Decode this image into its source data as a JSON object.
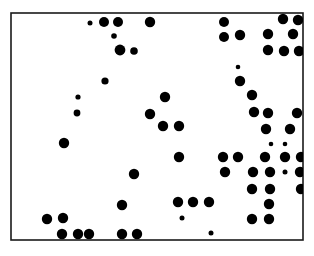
{
  "figure": {
    "name": "distribution-dot-map",
    "type": "dot-distribution-map",
    "background_color": "#ffffff",
    "ink_color": "#000000",
    "caption": "",
    "title": ""
  },
  "frame": {
    "x": 11,
    "y": 13,
    "width": 292,
    "height": 227,
    "stroke_color": "#1a1a1a",
    "stroke_width": 1.6
  },
  "grid": {
    "columns": 4,
    "rows": 3,
    "vertical_lines_x": [
      86,
      156,
      230
    ],
    "horizontal_lines_y": [
      89,
      165
    ],
    "stroke_color": "#1a1a1a",
    "stroke_width": 1.1
  },
  "rivers": [
    {
      "name": "western-river",
      "points": "33,33 38,29 44,28 49,32 55,35 60,33 65,35 68,40 72,43 74,48 72,53 73,58 76,61 78,66 76,71 78,76 77,81 79,86 77,91 79,96 78,101 80,106 78,111 81,116 80,121 83,126 86,130 90,134 94,138 99,142 104,147 108,152 110,157 112,162 111,167 113,172 112,177 114,182 113,187 115,192 114,197 116,202 118,207 120,212 121,217 120,223 122,228 122,234 122,239"
    },
    {
      "name": "eastern-river",
      "points": "156,12 158,18 157,24 159,30 161,36 163,42 166,48 169,54 172,59 175,64 179,69 183,73 187,77 190,82 193,87 196,91 199,95 203,98 206,101 209,103 212,101 215,99 217,96 215,92 212,90 209,89 206,87 204,84 203,80 205,77 209,76 213,75 217,73 219,70 221,66 224,63 227,61 230,59 233,57 236,54 239,50 241,45 243,40 245,35 247,30 249,25 251,20 253,15 254,12"
    },
    {
      "name": "central-river",
      "points": "230,89 232,93 234,97 237,101 240,105 243,109 246,113 248,118 250,123 252,128 253,133 255,138 257,143 256,148 254,152 252,157 250,162 249,167 250,172 252,177 254,182 253,187 250,190 246,192 242,193 238,194 234,196 231,199 228,202 224,205 221,209 218,213 216,218 215,223 214,229 214,234 213,239"
    },
    {
      "name": "river-tributary-lower",
      "points": "229,194 224,193 220,194 217,197 215,201 212,203 209,202 207,199 205,197 202,198 200,202 199,207 199,212 200,217 199,222 200,227 201,232 201,238"
    }
  ],
  "dots": [
    {
      "cell": "r1c2",
      "x": 90,
      "y": 23,
      "r": 2.5
    },
    {
      "cell": "r1c2",
      "x": 104,
      "y": 22,
      "r": 5.0
    },
    {
      "cell": "r1c2",
      "x": 118,
      "y": 22,
      "r": 5.0
    },
    {
      "cell": "r1c2",
      "x": 150,
      "y": 22,
      "r": 5.2
    },
    {
      "cell": "r1c2",
      "x": 114,
      "y": 36,
      "r": 2.8
    },
    {
      "cell": "r1c2",
      "x": 120,
      "y": 50,
      "r": 5.4
    },
    {
      "cell": "r1c2",
      "x": 134,
      "y": 51,
      "r": 3.8
    },
    {
      "cell": "r1c2",
      "x": 105,
      "y": 81,
      "r": 3.6
    },
    {
      "cell": "r1c3",
      "x": 224,
      "y": 22,
      "r": 5.0
    },
    {
      "cell": "r1c3",
      "x": 224,
      "y": 37,
      "r": 5.0
    },
    {
      "cell": "r1c4",
      "x": 240,
      "y": 35,
      "r": 5.2
    },
    {
      "cell": "r1c4",
      "x": 283,
      "y": 19,
      "r": 5.2
    },
    {
      "cell": "r1c4",
      "x": 298,
      "y": 20,
      "r": 5.2
    },
    {
      "cell": "r1c4",
      "x": 268,
      "y": 34,
      "r": 5.2
    },
    {
      "cell": "r1c4",
      "x": 293,
      "y": 34,
      "r": 5.2
    },
    {
      "cell": "r1c4",
      "x": 268,
      "y": 50,
      "r": 5.2
    },
    {
      "cell": "r1c4",
      "x": 284,
      "y": 51,
      "r": 5.2
    },
    {
      "cell": "r1c4",
      "x": 299,
      "y": 51,
      "r": 5.2
    },
    {
      "cell": "r1c4",
      "x": 238,
      "y": 67,
      "r": 2.3
    },
    {
      "cell": "r1c4",
      "x": 240,
      "y": 81,
      "r": 5.2
    },
    {
      "cell": "r2c1",
      "x": 78,
      "y": 97,
      "r": 2.6
    },
    {
      "cell": "r2c1",
      "x": 77,
      "y": 113,
      "r": 3.4
    },
    {
      "cell": "r2c1",
      "x": 64,
      "y": 143,
      "r": 5.2
    },
    {
      "cell": "r2c2",
      "x": 150,
      "y": 114,
      "r": 5.2
    },
    {
      "cell": "r2c3",
      "x": 165,
      "y": 97,
      "r": 5.2
    },
    {
      "cell": "r2c3",
      "x": 163,
      "y": 126,
      "r": 5.2
    },
    {
      "cell": "r2c3",
      "x": 179,
      "y": 126,
      "r": 5.2
    },
    {
      "cell": "r2c3",
      "x": 179,
      "y": 157,
      "r": 5.2
    },
    {
      "cell": "r2c3",
      "x": 223,
      "y": 157,
      "r": 5.2
    },
    {
      "cell": "r2c4",
      "x": 252,
      "y": 95,
      "r": 5.2
    },
    {
      "cell": "r2c4",
      "x": 254,
      "y": 112,
      "r": 5.2
    },
    {
      "cell": "r2c4",
      "x": 268,
      "y": 113,
      "r": 5.2
    },
    {
      "cell": "r2c4",
      "x": 297,
      "y": 113,
      "r": 5.2
    },
    {
      "cell": "r2c4",
      "x": 266,
      "y": 129,
      "r": 5.2
    },
    {
      "cell": "r2c4",
      "x": 290,
      "y": 129,
      "r": 5.2
    },
    {
      "cell": "r2c4",
      "x": 271,
      "y": 144,
      "r": 2.3
    },
    {
      "cell": "r2c4",
      "x": 285,
      "y": 144,
      "r": 2.3
    },
    {
      "cell": "r2c4",
      "x": 238,
      "y": 157,
      "r": 5.2
    },
    {
      "cell": "r2c4",
      "x": 265,
      "y": 157,
      "r": 5.2
    },
    {
      "cell": "r2c4",
      "x": 285,
      "y": 157,
      "r": 5.2
    },
    {
      "cell": "r2c4",
      "x": 301,
      "y": 157,
      "r": 5.2
    },
    {
      "cell": "r3c1",
      "x": 47,
      "y": 219,
      "r": 5.2
    },
    {
      "cell": "r3c1",
      "x": 63,
      "y": 218,
      "r": 5.2
    },
    {
      "cell": "r3c1",
      "x": 62,
      "y": 234,
      "r": 5.2
    },
    {
      "cell": "r3c1",
      "x": 78,
      "y": 234,
      "r": 5.2
    },
    {
      "cell": "r3c2",
      "x": 89,
      "y": 234,
      "r": 5.2
    },
    {
      "cell": "r3c2",
      "x": 134,
      "y": 174,
      "r": 5.2
    },
    {
      "cell": "r3c2",
      "x": 122,
      "y": 205,
      "r": 5.2
    },
    {
      "cell": "r3c2",
      "x": 122,
      "y": 234,
      "r": 5.2
    },
    {
      "cell": "r3c2",
      "x": 137,
      "y": 234,
      "r": 5.2
    },
    {
      "cell": "r3c3",
      "x": 225,
      "y": 172,
      "r": 5.2
    },
    {
      "cell": "r3c3",
      "x": 178,
      "y": 202,
      "r": 5.2
    },
    {
      "cell": "r3c3",
      "x": 193,
      "y": 202,
      "r": 5.2
    },
    {
      "cell": "r3c3",
      "x": 209,
      "y": 202,
      "r": 5.2
    },
    {
      "cell": "r3c3",
      "x": 182,
      "y": 218,
      "r": 2.5
    },
    {
      "cell": "r3c3",
      "x": 211,
      "y": 233,
      "r": 2.5
    },
    {
      "cell": "r3c4",
      "x": 253,
      "y": 172,
      "r": 5.2
    },
    {
      "cell": "r3c4",
      "x": 270,
      "y": 172,
      "r": 5.2
    },
    {
      "cell": "r3c4",
      "x": 285,
      "y": 172,
      "r": 2.5
    },
    {
      "cell": "r3c4",
      "x": 300,
      "y": 172,
      "r": 5.2
    },
    {
      "cell": "r3c4",
      "x": 252,
      "y": 189,
      "r": 5.2
    },
    {
      "cell": "r3c4",
      "x": 270,
      "y": 189,
      "r": 5.2
    },
    {
      "cell": "r3c4",
      "x": 301,
      "y": 189,
      "r": 5.2
    },
    {
      "cell": "r3c4",
      "x": 269,
      "y": 204,
      "r": 5.2
    },
    {
      "cell": "r3c4",
      "x": 252,
      "y": 219,
      "r": 5.2
    },
    {
      "cell": "r3c4",
      "x": 269,
      "y": 219,
      "r": 5.2
    }
  ],
  "summary": {
    "total_dots": 66,
    "large_dot_count": 56,
    "small_dot_count": 10
  }
}
